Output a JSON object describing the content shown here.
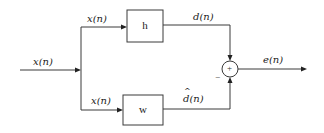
{
  "diagram": {
    "type": "adaptive-filter-block-diagram",
    "blocks": {
      "h": {
        "label": "h"
      },
      "w": {
        "label": "w"
      }
    },
    "summing_junction": {
      "plus_sign": "+",
      "minus_sign": "−"
    },
    "signals": {
      "input": "x(n)",
      "to_h": "x(n)",
      "to_w": "x(n)",
      "h_output": "d(n)",
      "w_output_base": "d",
      "w_output_suffix": "(n)",
      "error_output": "e(n)"
    },
    "colors": {
      "line": "#3a3a3a",
      "text": "#222222",
      "background": "#ffffff"
    }
  }
}
